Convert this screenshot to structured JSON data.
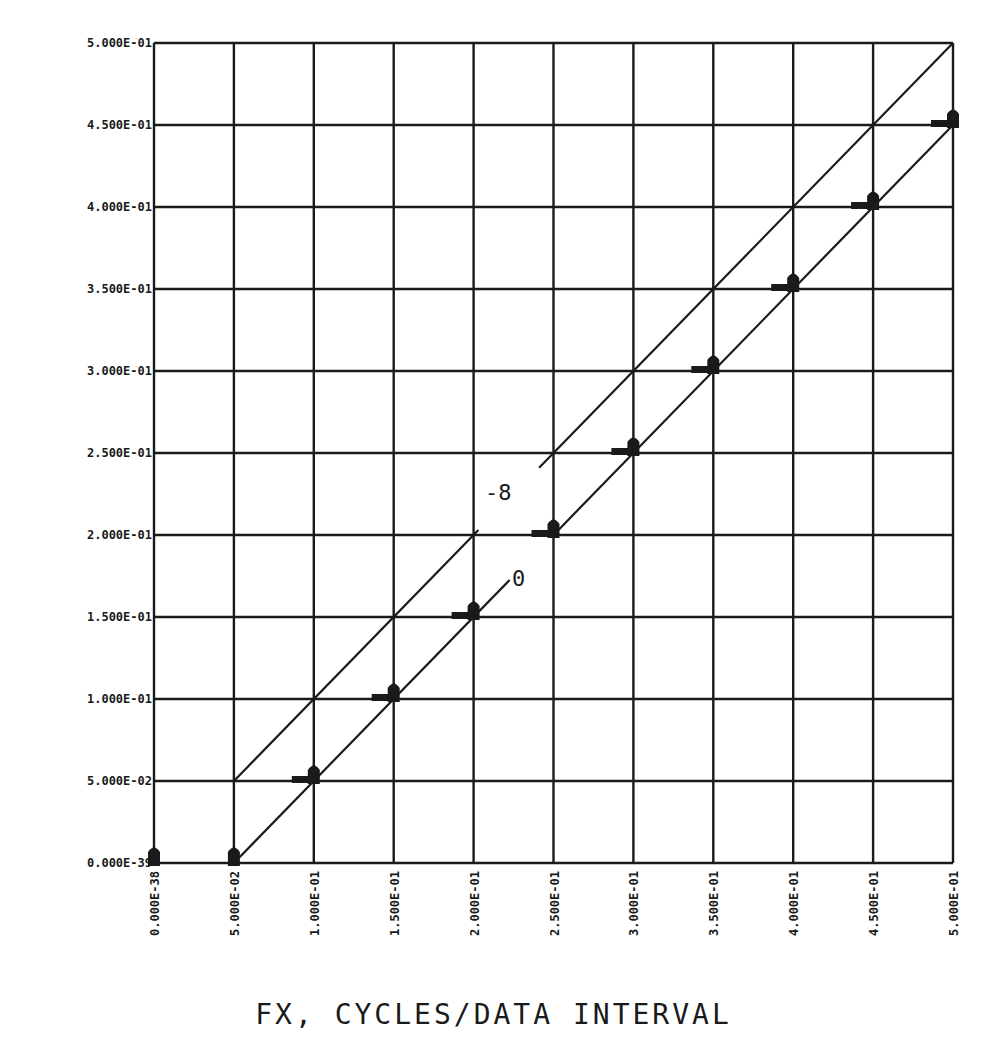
{
  "chart_data": {
    "type": "scatter",
    "title": "",
    "xlabel": "FX, CYCLES/DATA INTERVAL",
    "ylabel": "",
    "xlim": [
      0,
      0.5
    ],
    "ylim": [
      0,
      0.5
    ],
    "grid": true,
    "x_ticks": [
      "0.000E-38",
      "5.000E-02",
      "1.000E-01",
      "1.500E-01",
      "2.000E-01",
      "2.500E-01",
      "3.000E-01",
      "3.500E-01",
      "4.000E-01",
      "4.500E-01",
      "5.000E-01"
    ],
    "y_ticks": [
      "0.000E-39",
      "5.000E-02",
      "1.000E-01",
      "1.500E-01",
      "2.000E-01",
      "2.500E-01",
      "3.000E-01",
      "3.500E-01",
      "4.000E-01",
      "4.500E-01",
      "5.000E-01"
    ],
    "series": [
      {
        "name": "markers",
        "x": [
          0.0,
          0.05,
          0.1,
          0.15,
          0.2,
          0.25,
          0.3,
          0.35,
          0.4,
          0.45,
          0.5
        ],
        "y": [
          0.0,
          0.0,
          0.05,
          0.1,
          0.15,
          0.2,
          0.25,
          0.3,
          0.35,
          0.4,
          0.45
        ]
      },
      {
        "name": "line -8",
        "x": [
          0.05,
          0.5
        ],
        "y": [
          0.05,
          0.5
        ],
        "label": "-8"
      },
      {
        "name": "line 0",
        "x": [
          0.05,
          0.5
        ],
        "y": [
          0.0,
          0.45
        ],
        "label": "0"
      }
    ],
    "annotations": [
      {
        "text": "-8",
        "x": 0.225,
        "y": 0.225
      },
      {
        "text": "0",
        "x": 0.228,
        "y": 0.17
      }
    ]
  }
}
